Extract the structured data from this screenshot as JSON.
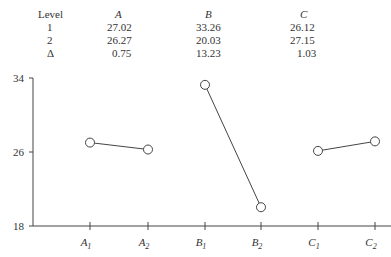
{
  "table": {
    "headers": [
      "Level",
      "A",
      "B",
      "C"
    ],
    "rows": [
      [
        "1",
        "27.02",
        "33.26",
        "26.12"
      ],
      [
        "2",
        "26.27",
        "20.03",
        "27.15"
      ],
      [
        "Δ",
        "0.75",
        "13.23",
        "1.03"
      ]
    ]
  },
  "chart_data": {
    "type": "line",
    "title": "",
    "xlabel": "",
    "ylabel": "",
    "ylim": [
      18,
      34
    ],
    "yticks": [
      18,
      26,
      34
    ],
    "categories": [
      "A1",
      "A2",
      "B1",
      "B2",
      "C1",
      "C2"
    ],
    "series": [
      {
        "name": "A",
        "x": [
          "A1",
          "A2"
        ],
        "values": [
          27.02,
          26.27
        ]
      },
      {
        "name": "B",
        "x": [
          "B1",
          "B2"
        ],
        "values": [
          33.26,
          20.03
        ]
      },
      {
        "name": "C",
        "x": [
          "C1",
          "C2"
        ],
        "values": [
          26.12,
          27.15
        ]
      }
    ],
    "grid": false,
    "marker": "open-circle"
  },
  "axis": {
    "y_labels": [
      "34",
      "26",
      "18"
    ],
    "x_labels": [
      {
        "base": "A",
        "sub": "1"
      },
      {
        "base": "A",
        "sub": "2"
      },
      {
        "base": "B",
        "sub": "1"
      },
      {
        "base": "B",
        "sub": "2"
      },
      {
        "base": "C",
        "sub": "1"
      },
      {
        "base": "C",
        "sub": "2"
      }
    ]
  }
}
